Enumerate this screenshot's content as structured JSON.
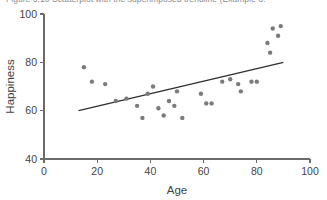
{
  "caption": {
    "text": "Figure 6.10  Scatterplot with the superimposed trendline (Example 6."
  },
  "chart_data": {
    "type": "scatter",
    "title": "",
    "subtitle": "",
    "xlabel": "Age",
    "ylabel": "Happiness",
    "xlim": [
      0,
      100
    ],
    "ylim": [
      40,
      100
    ],
    "xticks": [
      0,
      20,
      40,
      60,
      80,
      100
    ],
    "yticks": [
      40,
      60,
      80,
      100
    ],
    "xtick_labels": [
      "0",
      "20",
      "40",
      "60",
      "80",
      "100"
    ],
    "ytick_labels": [
      "40",
      "60",
      "80",
      "100"
    ],
    "grid": false,
    "legend": null,
    "point_color": "#7b7b7b",
    "point_size": 4.4,
    "series": [
      {
        "name": "Observations",
        "marker": "circle",
        "points": [
          [
            15,
            78
          ],
          [
            18,
            72
          ],
          [
            23,
            71
          ],
          [
            27,
            64
          ],
          [
            31,
            65
          ],
          [
            35,
            62
          ],
          [
            37,
            57
          ],
          [
            39,
            67
          ],
          [
            41,
            70
          ],
          [
            43,
            61
          ],
          [
            45,
            58
          ],
          [
            47,
            64
          ],
          [
            49,
            62
          ],
          [
            50,
            68
          ],
          [
            52,
            57
          ],
          [
            59,
            67
          ],
          [
            61,
            63
          ],
          [
            63,
            63
          ],
          [
            67,
            72
          ],
          [
            70,
            73
          ],
          [
            73,
            71
          ],
          [
            74,
            68
          ],
          [
            78,
            72
          ],
          [
            80,
            72
          ],
          [
            84,
            88
          ],
          [
            85,
            84
          ],
          [
            86,
            94
          ],
          [
            88,
            91
          ],
          [
            89,
            95
          ]
        ]
      }
    ],
    "trendline": {
      "name": "Trendline",
      "color": "#2e2e2e",
      "x_start": 13,
      "y_start": 60,
      "x_end": 90,
      "y_end": 80
    }
  }
}
